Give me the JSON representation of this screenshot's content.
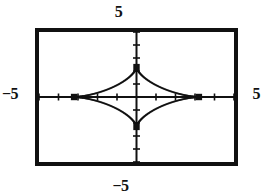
{
  "figure": {
    "kind": "graphing-calculator-plot",
    "background_color": "#ffffff",
    "ink_color": "#111111",
    "frame_color": "#111111"
  },
  "labels": {
    "top": "5",
    "bottom": "−5",
    "left": "−5",
    "right": "5"
  },
  "chart_data": {
    "type": "line",
    "title": "",
    "subtitle": "",
    "xlabel": "",
    "ylabel": "",
    "xlim": [
      -5,
      5
    ],
    "ylim": [
      -5,
      5
    ],
    "grid": false,
    "legend": null,
    "legend_position": "none",
    "axes": {
      "x_axis_drawn": true,
      "y_axis_drawn": true,
      "x_tick_labels": [
        "−5",
        "5"
      ],
      "y_tick_labels": [
        "5",
        "−5"
      ],
      "x_tick_step": 1,
      "y_tick_step": 1,
      "tick_marks_only": true
    },
    "series": [
      {
        "name": "astroid",
        "style": "dotted-pixel-curve",
        "color": "#111111",
        "equation_form": "x = a*cos(t)^3, y = b*sin(t)^3",
        "a": 3.2,
        "b": 2.3,
        "closed": true,
        "points": [
          [
            3.2,
            0.0
          ],
          [
            3.14,
            0.01
          ],
          [
            2.96,
            0.06
          ],
          [
            2.67,
            0.16
          ],
          [
            2.3,
            0.3
          ],
          [
            1.87,
            0.47
          ],
          [
            1.42,
            0.67
          ],
          [
            0.98,
            0.89
          ],
          [
            0.6,
            1.12
          ],
          [
            0.3,
            1.36
          ],
          [
            0.11,
            1.6
          ],
          [
            0.02,
            1.85
          ],
          [
            0.0,
            2.3
          ],
          [
            -0.02,
            1.85
          ],
          [
            -0.11,
            1.6
          ],
          [
            -0.3,
            1.36
          ],
          [
            -0.6,
            1.12
          ],
          [
            -0.98,
            0.89
          ],
          [
            -1.42,
            0.67
          ],
          [
            -1.87,
            0.47
          ],
          [
            -2.3,
            0.3
          ],
          [
            -2.67,
            0.16
          ],
          [
            -2.96,
            0.06
          ],
          [
            -3.14,
            0.01
          ],
          [
            -3.2,
            0.0
          ],
          [
            -3.14,
            -0.01
          ],
          [
            -2.96,
            -0.06
          ],
          [
            -2.67,
            -0.16
          ],
          [
            -2.3,
            -0.3
          ],
          [
            -1.87,
            -0.47
          ],
          [
            -1.42,
            -0.67
          ],
          [
            -0.98,
            -0.89
          ],
          [
            -0.6,
            -1.12
          ],
          [
            -0.3,
            -1.36
          ],
          [
            -0.11,
            -1.6
          ],
          [
            -0.02,
            -1.85
          ],
          [
            0.0,
            -2.3
          ],
          [
            0.02,
            -1.85
          ],
          [
            0.11,
            -1.6
          ],
          [
            0.3,
            -1.36
          ],
          [
            0.6,
            -1.12
          ],
          [
            0.98,
            -0.89
          ],
          [
            1.42,
            -0.67
          ],
          [
            1.87,
            -0.47
          ],
          [
            2.3,
            -0.3
          ],
          [
            2.67,
            -0.16
          ],
          [
            2.96,
            -0.06
          ],
          [
            3.14,
            -0.01
          ],
          [
            3.2,
            0.0
          ]
        ]
      }
    ],
    "markers": {
      "name": "cusp-points",
      "shape": "square",
      "color": "#111111",
      "points": [
        [
          3.2,
          0.0
        ],
        [
          -3.2,
          0.0
        ],
        [
          0.0,
          2.3
        ],
        [
          0.0,
          -2.3
        ]
      ]
    },
    "annotations": [
      {
        "text": "5",
        "position": "top",
        "value": 5
      },
      {
        "text": "−5",
        "position": "bottom",
        "value": -5
      },
      {
        "text": "−5",
        "position": "left",
        "value": -5
      },
      {
        "text": "5",
        "position": "right",
        "value": 5
      }
    ]
  }
}
